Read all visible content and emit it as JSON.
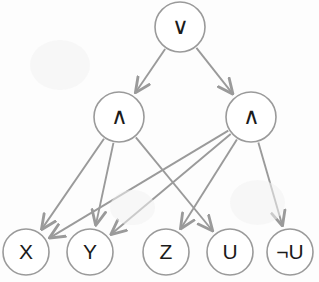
{
  "diagram": {
    "type": "directed-acyclic-graph",
    "background_color": "#fdfdfd",
    "node_stroke_color": "#9a9a9a",
    "node_fill_color": "#ffffff",
    "edge_color": "#9a9a9a",
    "label_color": "#1b1b1b",
    "nodes": [
      {
        "id": "or",
        "label": "∨",
        "role": "disjunction",
        "cx": 180,
        "cy": 27,
        "r": 25
      },
      {
        "id": "and1",
        "label": "∧",
        "role": "conjunction",
        "cx": 119,
        "cy": 117,
        "r": 25
      },
      {
        "id": "and2",
        "label": "∧",
        "role": "conjunction",
        "cx": 251,
        "cy": 117,
        "r": 25
      },
      {
        "id": "x",
        "label": "X",
        "role": "literal",
        "cx": 26,
        "cy": 252,
        "r": 23
      },
      {
        "id": "y",
        "label": "Y",
        "role": "literal",
        "cx": 90,
        "cy": 252,
        "r": 23
      },
      {
        "id": "z",
        "label": "Z",
        "role": "literal",
        "cx": 166,
        "cy": 252,
        "r": 23
      },
      {
        "id": "u",
        "label": "U",
        "role": "literal",
        "cx": 230,
        "cy": 252,
        "r": 23
      },
      {
        "id": "notu",
        "label": "¬U",
        "role": "literal",
        "cx": 290,
        "cy": 252,
        "r": 23
      }
    ],
    "edges": [
      {
        "from": "or",
        "to": "and1"
      },
      {
        "from": "or",
        "to": "and2"
      },
      {
        "from": "and1",
        "to": "x"
      },
      {
        "from": "and1",
        "to": "y"
      },
      {
        "from": "and1",
        "to": "u"
      },
      {
        "from": "and2",
        "to": "x"
      },
      {
        "from": "and2",
        "to": "y"
      },
      {
        "from": "and2",
        "to": "z"
      },
      {
        "from": "and2",
        "to": "notu"
      }
    ]
  }
}
